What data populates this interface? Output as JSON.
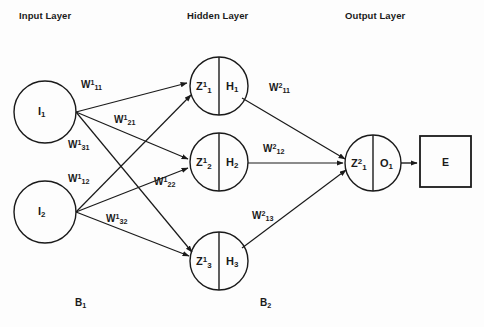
{
  "diagram": {
    "background_color": "#fdfdfd",
    "stroke_color": "#1a1a1a",
    "layer_titles": {
      "input": "Input Layer",
      "hidden": "Hidden Layer",
      "output": "Output Layer"
    },
    "input_nodes": [
      {
        "id": "i1",
        "base": "I",
        "sub": "1"
      },
      {
        "id": "i2",
        "base": "I",
        "sub": "2"
      }
    ],
    "hidden_nodes": [
      {
        "id": "h1",
        "left_base": "Z",
        "left_sup": "1",
        "left_sub": "1",
        "right_base": "H",
        "right_sub": "1"
      },
      {
        "id": "h2",
        "left_base": "Z",
        "left_sup": "1",
        "left_sub": "2",
        "right_base": "H",
        "right_sub": "2"
      },
      {
        "id": "h3",
        "left_base": "Z",
        "left_sup": "1",
        "left_sub": "3",
        "right_base": "H",
        "right_sub": "3"
      }
    ],
    "output_nodes": [
      {
        "id": "o1",
        "left_base": "Z",
        "left_sup": "2",
        "left_sub": "1",
        "right_base": "O",
        "right_sub": "1"
      }
    ],
    "error_box": {
      "label": "E"
    },
    "layer1_weights": [
      {
        "id": "w1_11",
        "base": "W",
        "sup": "1",
        "sub": "11"
      },
      {
        "id": "w1_21",
        "base": "W",
        "sup": "1",
        "sub": "21"
      },
      {
        "id": "w1_31",
        "base": "W",
        "sup": "1",
        "sub": "31"
      },
      {
        "id": "w1_12",
        "base": "W",
        "sup": "1",
        "sub": "12"
      },
      {
        "id": "w1_22",
        "base": "W",
        "sup": "1",
        "sub": "22"
      },
      {
        "id": "w1_32",
        "base": "W",
        "sup": "1",
        "sub": "32"
      }
    ],
    "layer2_weights": [
      {
        "id": "w2_11",
        "base": "W",
        "sup": "2",
        "sub": "11"
      },
      {
        "id": "w2_12",
        "base": "W",
        "sup": "2",
        "sub": "12"
      },
      {
        "id": "w2_13",
        "base": "W",
        "sup": "2",
        "sub": "13"
      }
    ],
    "biases": [
      {
        "id": "b1",
        "base": "B",
        "sub": "1"
      },
      {
        "id": "b2",
        "base": "B",
        "sub": "2"
      }
    ]
  }
}
